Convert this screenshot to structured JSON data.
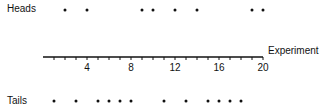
{
  "labels": {
    "heads": "Heads",
    "tails": "Tails",
    "axis": "Experiment"
  },
  "chart_data": {
    "type": "scatter",
    "title": "",
    "xlabel": "Experiment",
    "ylabel": "",
    "xlim": [
      0,
      20
    ],
    "xticks": [
      4,
      8,
      12,
      16,
      20
    ],
    "minor_tick_step": 1,
    "grid": false,
    "categories": [
      "Heads",
      "Tails"
    ],
    "series": [
      {
        "name": "Heads",
        "x": [
          2,
          4,
          9,
          10,
          12,
          14,
          19,
          20
        ]
      },
      {
        "name": "Tails",
        "x": [
          1,
          3,
          5,
          6,
          7,
          8,
          11,
          13,
          15,
          16,
          17,
          18
        ]
      }
    ],
    "counts": {
      "Heads": 8,
      "Tails": 12,
      "Total": 20
    }
  },
  "colors": {
    "ink": "#111111",
    "background": "#ffffff"
  }
}
